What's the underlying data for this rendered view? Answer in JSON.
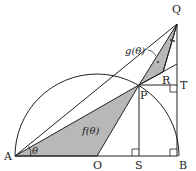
{
  "diagram": {
    "type": "geometry",
    "points": {
      "A": {
        "label": "A",
        "x": 15,
        "y": 156
      },
      "O": {
        "label": "O",
        "x": 97,
        "y": 156
      },
      "S": {
        "label": "S",
        "x": 139,
        "y": 156
      },
      "B": {
        "label": "B",
        "x": 177,
        "y": 156
      },
      "P": {
        "label": "P",
        "x": 139,
        "y": 85
      },
      "T": {
        "label": "T",
        "x": 177,
        "y": 85
      },
      "R": {
        "label": "R",
        "x": 163,
        "y": 72
      },
      "Q": {
        "label": "Q",
        "x": 177,
        "y": 24
      }
    },
    "angle_label": "θ",
    "region_labels": {
      "f": "f(θ)",
      "g": "g(θ)"
    },
    "colors": {
      "stroke": "#222222",
      "shade": "#b8b8b8"
    }
  }
}
